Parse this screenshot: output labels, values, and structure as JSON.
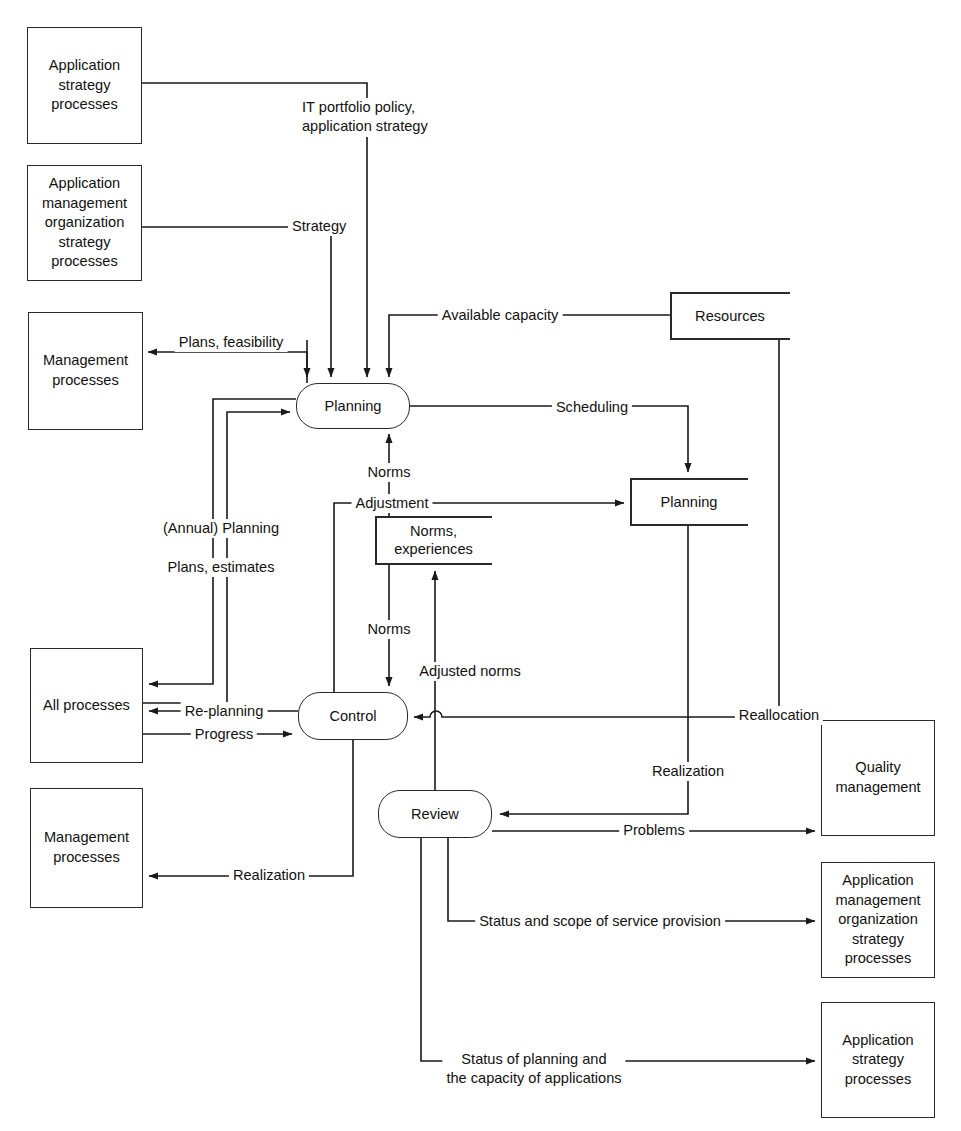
{
  "diagram": {
    "type": "data-flow-diagram",
    "line_color": "#2a2a2a",
    "background": "#ffffff"
  },
  "external_entities": [
    {
      "id": "app-strategy-processes-top",
      "label": "Application\nstrategy\nprocesses"
    },
    {
      "id": "app-mgmt-org-strategy-processes-top",
      "label": "Application\nmanagement\norganization\nstrategy\nprocesses"
    },
    {
      "id": "management-processes-top",
      "label": "Management\nprocesses"
    },
    {
      "id": "all-processes",
      "label": "All processes"
    },
    {
      "id": "management-processes-bottom",
      "label": "Management\nprocesses"
    },
    {
      "id": "quality-management",
      "label": "Quality\nmanagement"
    },
    {
      "id": "app-mgmt-org-strategy-processes-bottom",
      "label": "Application\nmanagement\norganization\nstrategy\nprocesses"
    },
    {
      "id": "app-strategy-processes-bottom",
      "label": "Application\nstrategy\nprocesses"
    }
  ],
  "processes": [
    {
      "id": "planning",
      "label": "Planning"
    },
    {
      "id": "control",
      "label": "Control"
    },
    {
      "id": "review",
      "label": "Review"
    }
  ],
  "datastores": [
    {
      "id": "resources",
      "label": "Resources"
    },
    {
      "id": "planning-store",
      "label": "Planning"
    },
    {
      "id": "norms-experiences",
      "label": "Norms,\nexperiences"
    }
  ],
  "flows": [
    {
      "id": "it-portfolio-policy",
      "label": "IT portfolio policy,\napplication strategy",
      "from": "app-strategy-processes-top",
      "to": "planning"
    },
    {
      "id": "strategy",
      "label": "Strategy",
      "from": "app-mgmt-org-strategy-processes-top",
      "to": "planning"
    },
    {
      "id": "available-capacity",
      "label": "Available capacity",
      "from": "resources",
      "to": "planning"
    },
    {
      "id": "plans-feasibility",
      "label": "Plans, feasibility",
      "from": "planning",
      "to": "management-processes-top"
    },
    {
      "id": "scheduling",
      "label": "Scheduling",
      "from": "planning",
      "to": "planning-store"
    },
    {
      "id": "norms-up",
      "label": "Norms",
      "from": "norms-experiences",
      "to": "planning"
    },
    {
      "id": "adjustment",
      "label": "Adjustment",
      "from": "control",
      "to": "planning-store"
    },
    {
      "id": "annual-planning",
      "label": "(Annual) Planning",
      "from": "planning",
      "to": "all-processes"
    },
    {
      "id": "plans-estimates",
      "label": "Plans, estimates",
      "from": "all-processes",
      "to": "planning"
    },
    {
      "id": "norms-down",
      "label": "Norms",
      "from": "norms-experiences",
      "to": "control"
    },
    {
      "id": "adjusted-norms",
      "label": "Adjusted norms",
      "from": "review",
      "to": "norms-experiences"
    },
    {
      "id": "re-planning",
      "label": "Re-planning",
      "from": "control",
      "to": "all-processes"
    },
    {
      "id": "progress",
      "label": "Progress",
      "from": "all-processes",
      "to": "control"
    },
    {
      "id": "reallocation",
      "label": "Reallocation",
      "from": "resources",
      "to": "control"
    },
    {
      "id": "realization-right",
      "label": "Realization",
      "from": "planning-store",
      "to": "review"
    },
    {
      "id": "problems",
      "label": "Problems",
      "from": "review",
      "to": "quality-management"
    },
    {
      "id": "realization-left",
      "label": "Realization",
      "from": "control",
      "to": "management-processes-bottom"
    },
    {
      "id": "status-scope-service",
      "label": "Status and scope of service provision",
      "from": "review",
      "to": "app-mgmt-org-strategy-processes-bottom"
    },
    {
      "id": "status-planning-capacity",
      "label": "Status of planning and\nthe capacity of applications",
      "from": "review",
      "to": "app-strategy-processes-bottom"
    }
  ]
}
